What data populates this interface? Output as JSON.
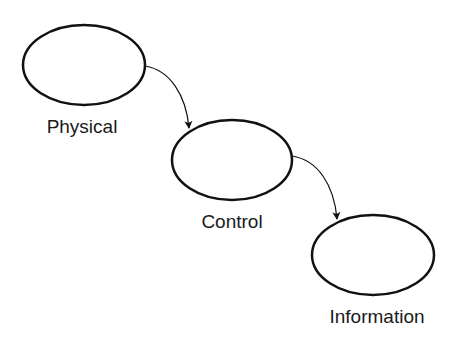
{
  "diagram": {
    "nodes": [
      {
        "id": "physical",
        "label": "Physical",
        "cx": 84,
        "cy": 65,
        "rx": 61,
        "ry": 40,
        "label_x": 82,
        "label_y": 116
      },
      {
        "id": "control",
        "label": "Control",
        "cx": 232,
        "cy": 160,
        "rx": 60,
        "ry": 40,
        "label_x": 232,
        "label_y": 211
      },
      {
        "id": "information",
        "label": "Information",
        "cx": 373,
        "cy": 255,
        "rx": 61,
        "ry": 40,
        "label_x": 377,
        "label_y": 306
      }
    ],
    "edges": [
      {
        "from": "physical",
        "to": "control"
      },
      {
        "from": "control",
        "to": "information"
      }
    ],
    "colors": {
      "stroke": "#111111",
      "background": "#ffffff",
      "text": "#1a1a1a"
    }
  }
}
